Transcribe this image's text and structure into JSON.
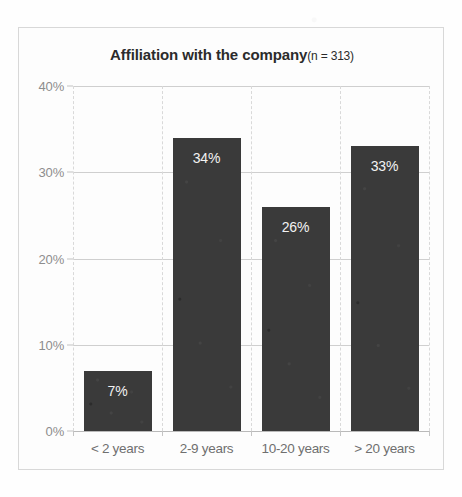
{
  "chart_data": {
    "type": "bar",
    "title": "Affiliation with the company",
    "subtitle": "(n = 313)",
    "xlabel": "",
    "ylabel": "",
    "categories": [
      "< 2 years",
      "2-9 years",
      "10-20 years",
      "> 20 years"
    ],
    "values": [
      7,
      34,
      26,
      33
    ],
    "value_labels": [
      "7%",
      "34%",
      "26%",
      "33%"
    ],
    "ylim": [
      0,
      40
    ],
    "y_ticks": [
      0,
      10,
      20,
      30,
      40
    ],
    "y_tick_labels": [
      "0%",
      "10%",
      "20%",
      "30%",
      "40%"
    ],
    "grid": "horizontal-solid-vertical-dashed",
    "legend": "none",
    "bar_color": "#3a3a3a",
    "value_label_color": "#f2f2f2",
    "gridline_color": "#cfcfcf",
    "axis_label_color": "#8d8d8d",
    "title_color": "#2b2b2b",
    "frame_color": "#d8d8d8",
    "background_color": "#fdfdfd"
  }
}
